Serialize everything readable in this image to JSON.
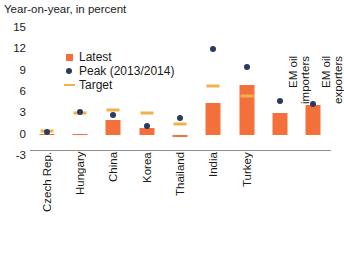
{
  "chart_data": {
    "type": "bar",
    "title": "Year-on-year, in percent",
    "xlabel": "",
    "ylabel": "",
    "ylim": [
      -3,
      15
    ],
    "yticks": [
      15,
      12,
      9,
      6,
      3,
      0,
      -3
    ],
    "grid": false,
    "legend_position": "upper-left-inside",
    "categories": [
      "Czech Rep.",
      "Hungary",
      "China",
      "Korea",
      "Thailand",
      "India",
      "Turkey",
      "EM oil importers",
      "EM oil exporters"
    ],
    "series": [
      {
        "name": "Latest",
        "type": "bar",
        "color": "#f4703a",
        "values": [
          0.1,
          0.1,
          2.0,
          1.0,
          -0.3,
          4.4,
          7.0,
          3.0,
          4.2
        ]
      },
      {
        "name": "Peak (2013/2014)",
        "type": "scatter",
        "color": "#2b3a63",
        "values": [
          0.4,
          3.2,
          2.8,
          1.2,
          2.3,
          12.1,
          9.5,
          4.7,
          4.3
        ]
      },
      {
        "name": "Target",
        "type": "marker-dash",
        "color": "#f0b24a",
        "values": [
          0.5,
          3.0,
          3.5,
          3.1,
          1.5,
          6.8,
          5.5,
          null,
          null
        ]
      }
    ]
  },
  "legend": {
    "items": [
      {
        "label": "Latest",
        "icon": "square-marker-icon"
      },
      {
        "label": "Peak (2013/2014)",
        "icon": "circle-marker-icon"
      },
      {
        "label": "Target",
        "icon": "dash-marker-icon"
      }
    ]
  }
}
